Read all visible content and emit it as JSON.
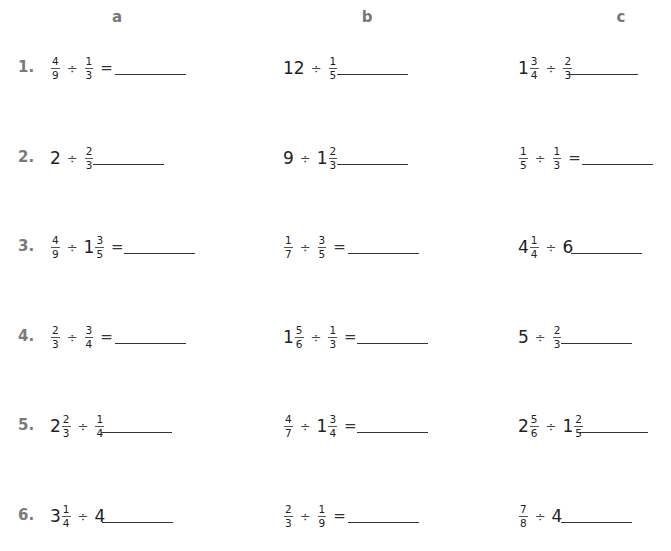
{
  "columns": [
    {
      "label": "a",
      "x": 102
    },
    {
      "label": "b",
      "x": 352
    },
    {
      "label": "c",
      "x": 606
    }
  ],
  "rows": [
    {
      "number": "1.",
      "y": 48,
      "problems": [
        {
          "col": "a",
          "x": 50,
          "answer_x": 115,
          "terms": [
            {
              "fraction": {
                "n": "4",
                "d": "9"
              }
            },
            {
              "op": "÷"
            },
            {
              "fraction": {
                "n": "1",
                "d": "3"
              }
            }
          ],
          "equals": "="
        },
        {
          "col": "b",
          "x": 283,
          "answer_x": 337,
          "terms": [
            {
              "whole": "12"
            },
            {
              "op": "÷"
            },
            {
              "fraction": {
                "n": "1",
                "d": "5"
              }
            }
          ],
          "equals": ""
        },
        {
          "col": "c",
          "x": 518,
          "answer_x": 567,
          "terms": [
            {
              "whole": "1",
              "fraction": {
                "n": "3",
                "d": "4"
              }
            },
            {
              "op": "÷"
            },
            {
              "fraction": {
                "n": "2",
                "d": "3"
              }
            }
          ],
          "equals": ""
        }
      ]
    },
    {
      "number": "2.",
      "y": 138,
      "problems": [
        {
          "col": "a",
          "x": 50,
          "answer_x": 93,
          "terms": [
            {
              "whole": "2"
            },
            {
              "op": "÷"
            },
            {
              "fraction": {
                "n": "2",
                "d": "3"
              }
            }
          ],
          "equals": ""
        },
        {
          "col": "b",
          "x": 283,
          "answer_x": 337,
          "terms": [
            {
              "whole": "9"
            },
            {
              "op": "÷"
            },
            {
              "whole": "1",
              "fraction": {
                "n": "2",
                "d": "3"
              }
            }
          ],
          "equals": ""
        },
        {
          "col": "c",
          "x": 518,
          "answer_x": 582,
          "terms": [
            {
              "fraction": {
                "n": "1",
                "d": "5"
              }
            },
            {
              "op": "÷"
            },
            {
              "fraction": {
                "n": "1",
                "d": "3"
              }
            }
          ],
          "equals": "="
        }
      ]
    },
    {
      "number": "3.",
      "y": 227,
      "problems": [
        {
          "col": "a",
          "x": 50,
          "answer_x": 124,
          "terms": [
            {
              "fraction": {
                "n": "4",
                "d": "9"
              }
            },
            {
              "op": "÷"
            },
            {
              "whole": "1",
              "fraction": {
                "n": "3",
                "d": "5"
              }
            }
          ],
          "equals": "="
        },
        {
          "col": "b",
          "x": 283,
          "answer_x": 348,
          "terms": [
            {
              "fraction": {
                "n": "1",
                "d": "7"
              }
            },
            {
              "op": "÷"
            },
            {
              "fraction": {
                "n": "3",
                "d": "5"
              }
            }
          ],
          "equals": "="
        },
        {
          "col": "c",
          "x": 518,
          "answer_x": 571,
          "terms": [
            {
              "whole": "4",
              "fraction": {
                "n": "1",
                "d": "4"
              }
            },
            {
              "op": "÷"
            },
            {
              "whole": "6"
            }
          ],
          "equals": ""
        }
      ]
    },
    {
      "number": "4.",
      "y": 317,
      "problems": [
        {
          "col": "a",
          "x": 50,
          "answer_x": 115,
          "terms": [
            {
              "fraction": {
                "n": "2",
                "d": "3"
              }
            },
            {
              "op": "÷"
            },
            {
              "fraction": {
                "n": "3",
                "d": "4"
              }
            }
          ],
          "equals": "="
        },
        {
          "col": "b",
          "x": 283,
          "answer_x": 357,
          "terms": [
            {
              "whole": "1",
              "fraction": {
                "n": "5",
                "d": "6"
              }
            },
            {
              "op": "÷"
            },
            {
              "fraction": {
                "n": "1",
                "d": "3"
              }
            }
          ],
          "equals": "="
        },
        {
          "col": "c",
          "x": 518,
          "answer_x": 561,
          "terms": [
            {
              "whole": "5"
            },
            {
              "op": "÷"
            },
            {
              "fraction": {
                "n": "2",
                "d": "3"
              }
            }
          ],
          "equals": ""
        }
      ]
    },
    {
      "number": "5.",
      "y": 406,
      "problems": [
        {
          "col": "a",
          "x": 50,
          "answer_x": 101,
          "terms": [
            {
              "whole": "2",
              "fraction": {
                "n": "2",
                "d": "3"
              }
            },
            {
              "op": "÷"
            },
            {
              "fraction": {
                "n": "1",
                "d": "4"
              }
            }
          ],
          "equals": ""
        },
        {
          "col": "b",
          "x": 283,
          "answer_x": 357,
          "terms": [
            {
              "fraction": {
                "n": "4",
                "d": "7"
              }
            },
            {
              "op": "÷"
            },
            {
              "whole": "1",
              "fraction": {
                "n": "3",
                "d": "4"
              }
            }
          ],
          "equals": "="
        },
        {
          "col": "c",
          "x": 518,
          "answer_x": 577,
          "terms": [
            {
              "whole": "2",
              "fraction": {
                "n": "5",
                "d": "6"
              }
            },
            {
              "op": "÷"
            },
            {
              "whole": "1",
              "fraction": {
                "n": "2",
                "d": "5"
              }
            }
          ],
          "equals": ""
        }
      ]
    },
    {
      "number": "6.",
      "y": 496,
      "problems": [
        {
          "col": "a",
          "x": 50,
          "answer_x": 102,
          "terms": [
            {
              "whole": "3",
              "fraction": {
                "n": "1",
                "d": "4"
              }
            },
            {
              "op": "÷"
            },
            {
              "whole": "4"
            }
          ],
          "equals": ""
        },
        {
          "col": "b",
          "x": 283,
          "answer_x": 348,
          "terms": [
            {
              "fraction": {
                "n": "2",
                "d": "3"
              }
            },
            {
              "op": "÷"
            },
            {
              "fraction": {
                "n": "1",
                "d": "9"
              }
            }
          ],
          "equals": "="
        },
        {
          "col": "c",
          "x": 518,
          "answer_x": 561,
          "terms": [
            {
              "fraction": {
                "n": "7",
                "d": "8"
              }
            },
            {
              "op": "÷"
            },
            {
              "whole": "4"
            }
          ],
          "equals": ""
        }
      ]
    }
  ]
}
